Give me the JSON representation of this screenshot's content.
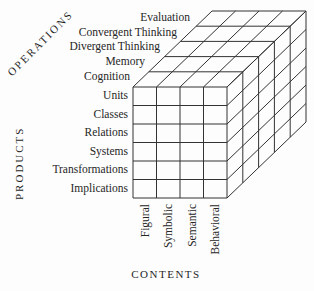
{
  "figure": {
    "operations": {
      "title": "OPERATIONS",
      "items": [
        "Evaluation",
        "Convergent Thinking",
        "Divergent Thinking",
        "Memory",
        "Cognition"
      ]
    },
    "products": {
      "title": "PRODUCTS",
      "items": [
        "Units",
        "Classes",
        "Relations",
        "Systems",
        "Transformations",
        "Implications"
      ]
    },
    "contents": {
      "title": "CONTENTS",
      "items": [
        "Figural",
        "Symbolic",
        "Semantic",
        "Behavioral"
      ]
    }
  },
  "colors": {
    "line": "#333333",
    "text": "#262626",
    "background": "#fdfdfd"
  }
}
